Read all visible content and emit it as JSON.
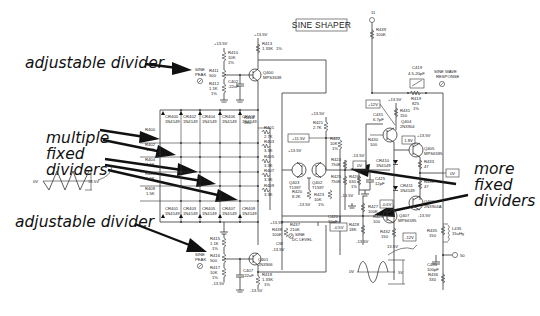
{
  "title": "SINE SHAPER",
  "annotations": {
    "adjustable_top": "adjustable divider",
    "multiple_fixed": [
      "multiple",
      "fixed",
      "dividers"
    ],
    "adjustable_bottom": "adjustable divider",
    "more_fixed": [
      "more",
      "fixed",
      "dividers"
    ]
  },
  "top_peak": {
    "supply": "+13.5V",
    "r410": [
      "R410",
      "10K",
      "1%"
    ],
    "r411": [
      "R411",
      "500"
    ],
    "r412": [
      "R412",
      "1.1K",
      "1%"
    ],
    "label": [
      "SINE",
      "PEAK"
    ],
    "c402": [
      "C402",
      ".22uF"
    ]
  },
  "q400": [
    "Q400",
    "MPS3638"
  ],
  "r413": [
    "R413",
    "1.33K",
    "1%"
  ],
  "q400_supply": "+13.5V",
  "diodes_top": [
    [
      "CR400",
      "1N4149"
    ],
    [
      "CR402",
      "1N4149"
    ],
    [
      "CR404",
      "1N4149"
    ],
    [
      "CR406",
      "1N4149"
    ],
    [
      "CR408",
      "1N4149"
    ]
  ],
  "diodes_bottom": [
    [
      "CR401",
      "1N4149"
    ],
    [
      "CR403",
      "1N4149"
    ],
    [
      "CR405",
      "1N4149"
    ],
    [
      "CR407",
      "1N4149"
    ],
    [
      "CR409",
      "1N4149"
    ]
  ],
  "r414": [
    "R414",
    "330"
  ],
  "left_ladder": [
    [
      "R400",
      ""
    ],
    [
      "R402",
      "1.5K"
    ],
    [
      "R404",
      "1.5K"
    ],
    [
      "R406",
      "1.5K"
    ],
    [
      "R408",
      "1.5K"
    ]
  ],
  "right_ladder": [
    [
      "R401",
      "2.7K"
    ],
    [
      "R403",
      "3.3K"
    ],
    [
      "R405",
      "3.3K"
    ],
    [
      "R407",
      "3.3K"
    ],
    [
      "R409",
      "3.3K"
    ]
  ],
  "input_wave": {
    "left": "0V",
    "right": "13.5V"
  },
  "bottom_peak": {
    "r415": [
      "R415",
      "1.1K",
      "1%"
    ],
    "r416": [
      "R416",
      "500"
    ],
    "r417": [
      "R417",
      "10K",
      "1%"
    ],
    "label": [
      "SINE",
      "PEAK"
    ],
    "supply": "-13.5V",
    "c407": [
      "C407",
      ".22uF"
    ]
  },
  "q401": [
    "Q401",
    "2N3906"
  ],
  "r418": [
    "R418",
    "1.33K",
    "1%"
  ],
  "q401_supply": "-13.5V",
  "diff_amp": {
    "supply_top": "+13.5V",
    "r421": [
      "R421",
      "2.7K"
    ],
    "v_box": "+11.5V",
    "r422": [
      "R422",
      "10K",
      "1%"
    ],
    "q403": [
      "Q403",
      "T1597"
    ],
    "q402": [
      "Q402",
      "T1597"
    ],
    "q_supply": "+13.5V",
    "r420": [
      "R420",
      "8.2K"
    ],
    "r423": [
      "R423",
      "10K",
      "1%"
    ],
    "neg": "-13.5V"
  },
  "dc_level": {
    "supply": "+13.5V",
    "r438": [
      "R438",
      "100K"
    ],
    "r437": [
      "R437",
      "210K"
    ],
    "label": [
      "SINE",
      "DC LEVEL"
    ],
    "cw": "CW",
    "neg": "-13.5V",
    "c420": [
      "C420",
      "10pF"
    ]
  },
  "mid": {
    "supply": "-13.5V",
    "r424": [
      "R424",
      "750K"
    ],
    "v0": "0V",
    "r425": [
      "R425",
      "750K"
    ],
    "r426": [
      "R426",
      "630",
      "1%"
    ],
    "c425": [
      "C425",
      "12pF"
    ],
    "neg": "-13.5V",
    "r427": [
      "R427",
      "100K"
    ],
    "r428": [
      "R428",
      "18K"
    ],
    "neg2": "-13.5V",
    "box_neg": "-0.5V",
    "r429": [
      "R429",
      "100"
    ]
  },
  "output_stage": {
    "pin": "11",
    "r439": [
      "R439",
      "100K"
    ],
    "c419": [
      "C419",
      "4.5-20pF"
    ],
    "response": [
      "SINE WAVE",
      "RESPONSE"
    ],
    "r419": [
      "R419",
      "825",
      "1%"
    ],
    "v12": "+12V",
    "supply": "+13.5V",
    "r431": [
      "R431",
      "150"
    ],
    "c431": [
      "C431",
      "6.7pF"
    ],
    "q404": [
      "Q404",
      "2N3904"
    ],
    "r430": [
      "R430",
      "100"
    ],
    "v18": "1.8V",
    "q405": [
      "Q405",
      "MPS6595"
    ],
    "cr410": [
      "CR410",
      "1N4149"
    ],
    "cr411": [
      "CR411",
      "1N4149"
    ],
    "r433": [
      "R433",
      "47"
    ],
    "r434": [
      "R434",
      "47"
    ],
    "v0out": "0V",
    "q406": [
      "Q406",
      "2N3904A"
    ],
    "box_06": "-0.6V",
    "q407": [
      "Q407",
      "MPS6595"
    ],
    "q407_supply": "-13.5V",
    "r432": [
      "R432",
      "150"
    ],
    "v_neg12": "-12V",
    "neg_bottom": "13.5V",
    "r435": [
      "R435",
      "150"
    ],
    "l435": [
      "L435",
      "15uHy"
    ],
    "c435": [
      "C435",
      "100pF"
    ],
    "r436": [
      "R436",
      "330"
    ],
    "out_label": "50"
  },
  "output_wave": {
    "left": "0V",
    "right": "5V"
  }
}
